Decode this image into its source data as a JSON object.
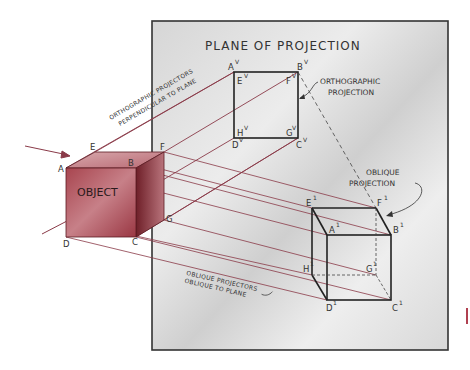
{
  "diagram": {
    "plane_title": "PLANE OF PROJECTION",
    "object_label": "OBJECT",
    "annotations": {
      "orthographic_projectors_line1": "ORTHOGRAPHIC PROJECTORS",
      "orthographic_projectors_line2": "PERPENDICULAR TO PLANE",
      "orthographic_projection_line1": "ORTHOGRAPHIC",
      "orthographic_projection_line2": "PROJECTION",
      "oblique_projection_line1": "OBLIQUE",
      "oblique_projection_line2": "PROJECTION",
      "oblique_projectors_line1": "OBLIQUE PROJECTORS",
      "oblique_projectors_line2": "OBLIQUE TO PLANE"
    },
    "object_vertices": {
      "A": "A",
      "B": "B",
      "C": "C",
      "D": "D",
      "E": "E",
      "F": "F",
      "G": "G"
    },
    "orthographic_vertices": {
      "A": "A",
      "B": "B",
      "C": "C",
      "D": "D",
      "E": "E",
      "F": "F",
      "G": "G",
      "H": "H",
      "suffix": "V"
    },
    "oblique_vertices": {
      "A": "A",
      "B": "B",
      "C": "C",
      "D": "D",
      "E": "E",
      "F": "F",
      "G": "G",
      "H": "H",
      "suffix": "1"
    },
    "colors": {
      "object_front": "#9b3a45",
      "object_side": "#7a2630",
      "object_top": "#c98a90",
      "projector_line": "#8a3a48",
      "plane_bg": "#e4e4e4",
      "plane_border": "#333333",
      "ink": "#222222"
    }
  }
}
